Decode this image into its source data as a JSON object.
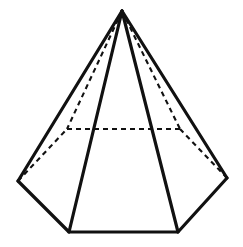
{
  "figure": {
    "background_color": "#ffffff",
    "line_color": "#111111",
    "solid_stroke_width": 3.2,
    "hidden_stroke_width": 2.1,
    "hidden_dash_pattern": "5 4",
    "canvas": {
      "width": 243,
      "height": 247
    },
    "vertices": {
      "apex": {
        "label": "apex",
        "x": 122,
        "y": 11,
        "visible": true
      },
      "base_left": {
        "label": "base-left",
        "x": 18,
        "y": 181,
        "visible": true
      },
      "base_bottom_left": {
        "label": "base-bottom-left",
        "x": 69,
        "y": 232,
        "visible": true
      },
      "base_bottom_right": {
        "label": "base-bottom-right",
        "x": 178,
        "y": 232,
        "visible": true
      },
      "base_right": {
        "label": "base-right",
        "x": 227,
        "y": 178,
        "visible": true
      },
      "base_back_right": {
        "label": "base-back-right",
        "x": 180,
        "y": 129,
        "visible": false
      },
      "base_back_left": {
        "label": "base-back-left",
        "x": 67,
        "y": 129,
        "visible": false
      }
    },
    "solid_edges": [
      {
        "name": "lateral-edge-apex-to-base-left",
        "from": "apex",
        "to": "base_left"
      },
      {
        "name": "lateral-edge-apex-to-base-bottom-left",
        "from": "apex",
        "to": "base_bottom_left"
      },
      {
        "name": "lateral-edge-apex-to-base-bottom-right",
        "from": "apex",
        "to": "base_bottom_right"
      },
      {
        "name": "lateral-edge-apex-to-base-right",
        "from": "apex",
        "to": "base_right"
      },
      {
        "name": "base-edge-left-to-bottom-left",
        "from": "base_left",
        "to": "base_bottom_left"
      },
      {
        "name": "base-edge-bottom-left-to-bottom-right",
        "from": "base_bottom_left",
        "to": "base_bottom_right"
      },
      {
        "name": "base-edge-bottom-right-to-right",
        "from": "base_bottom_right",
        "to": "base_right"
      }
    ],
    "hidden_edges": [
      {
        "name": "hidden-lateral-edge-apex-to-back-left",
        "from": "apex",
        "to": "base_back_left"
      },
      {
        "name": "hidden-lateral-edge-apex-to-back-right",
        "from": "apex",
        "to": "base_back_right"
      },
      {
        "name": "hidden-base-edge-back-left-to-back-right",
        "from": "base_back_left",
        "to": "base_back_right"
      },
      {
        "name": "hidden-base-edge-left-to-back-left",
        "from": "base_left",
        "to": "base_back_left"
      },
      {
        "name": "hidden-base-edge-right-to-back-right",
        "from": "base_right",
        "to": "base_back_right"
      }
    ],
    "base_outline_points": "18,181 69,232 178,232 227,178 180,129 67,129",
    "front_face_fill_points": "122,11 18,181 69,232 178,232 227,178",
    "paths": {
      "apex_to_base_left": "M 122 11 L 18 181",
      "apex_to_base_bottom_left": "M 122 11 L 69 232",
      "apex_to_base_bottom_right": "M 122 11 L 178 232",
      "apex_to_base_right": "M 122 11 L 227 178",
      "base_front_outline": "M 18 181 L 69 232 L 178 232 L 227 178",
      "apex_to_back_left": "M 122 11 L 67 129",
      "apex_to_back_right": "M 122 11 L 180 129",
      "back_base_horizontal": "M 67 129 L 180 129",
      "left_to_back_left": "M 18 181 L 67 129",
      "right_to_back_right": "M 227 178 L 180 129"
    }
  }
}
